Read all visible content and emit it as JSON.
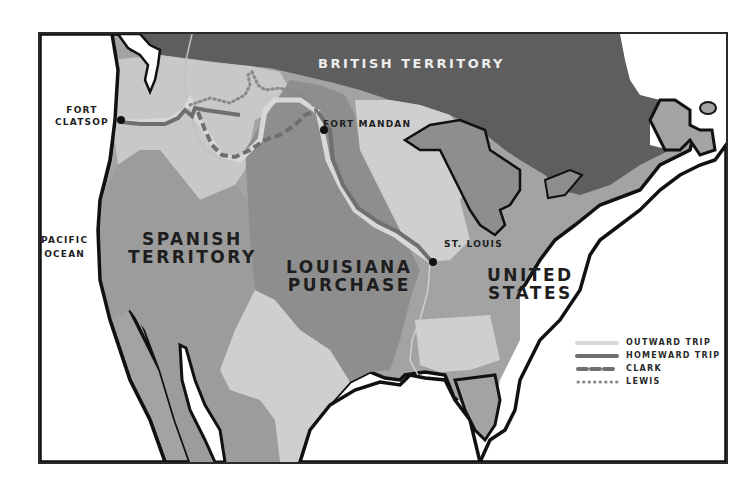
{
  "map": {
    "type": "historical-map",
    "subject": "Lewis and Clark Expedition routes",
    "colors": {
      "british_territory": "#5e5e5e",
      "louisiana_purchase": "#8e8e8e",
      "spanish_territory": "#9c9c9c",
      "united_states": "#a3a3a3",
      "oregon_country": "#c4c4c4",
      "light_regions": "#cfcfcf",
      "water": "#ffffff",
      "coastline": "#111111",
      "outward_trip": "#d8d8d8",
      "homeward_trip": "#6f6f6f",
      "clark": "#6f6f6f",
      "lewis": "#8a8a8a",
      "point": "#111111"
    },
    "regions": [
      {
        "id": "british",
        "label": "BRITISH TERRITORY"
      },
      {
        "id": "spanish",
        "label_line1": "SPANISH",
        "label_line2": "TERRITORY"
      },
      {
        "id": "louisiana",
        "label_line1": "LOUISIANA",
        "label_line2": "PURCHASE"
      },
      {
        "id": "us",
        "label_line1": "UNITED",
        "label_line2": "STATES"
      }
    ],
    "water_labels": [
      {
        "id": "pacific",
        "line1": "PACIFIC",
        "line2": "OCEAN"
      }
    ],
    "points": [
      {
        "id": "fort-clatsop",
        "line1": "FORT",
        "line2": "CLATSOP"
      },
      {
        "id": "fort-mandan",
        "label": "FORT MANDAN"
      },
      {
        "id": "st-louis",
        "label": "ST. LOUIS"
      }
    ]
  },
  "legend": {
    "items": [
      {
        "label": "OUTWARD TRIP",
        "style": "solid-light"
      },
      {
        "label": "HOMEWARD TRIP",
        "style": "solid-dark"
      },
      {
        "label": "CLARK",
        "style": "dashed"
      },
      {
        "label": "LEWIS",
        "style": "dotted"
      }
    ]
  }
}
